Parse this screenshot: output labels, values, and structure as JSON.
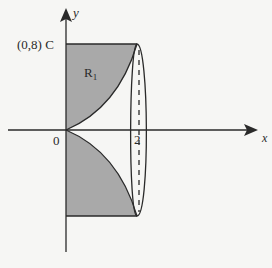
{
  "diagram": {
    "type": "solid-of-revolution region",
    "labels": {
      "y_axis": "y",
      "x_axis": "x",
      "origin": "0",
      "point_c": "(0,8) C",
      "region_main": "R",
      "region_sub": "1",
      "x_tick": "2"
    },
    "colors": {
      "background": "#f6f6f4",
      "shade": "#a9a9a9",
      "stroke": "#2a2a2a"
    }
  }
}
